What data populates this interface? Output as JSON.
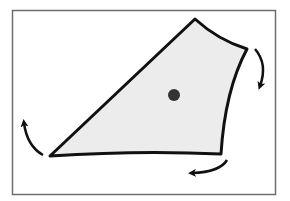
{
  "diagram": {
    "colors": {
      "background": "#ffffff",
      "frame": "#6e6e6e",
      "shape_fill": "#ececec",
      "shape_stroke": "#111111",
      "center_dot": "#333333",
      "arrows": "#111111"
    },
    "frame": {
      "x": 12,
      "y": 10,
      "width": 263,
      "height": 184
    },
    "shape": {
      "vertices": [
        {
          "name": "top",
          "x": 195,
          "y": 19
        },
        {
          "name": "right",
          "x": 247,
          "y": 49
        },
        {
          "name": "bottom-right",
          "x": 221,
          "y": 154
        },
        {
          "name": "left",
          "x": 50,
          "y": 156
        }
      ]
    },
    "center": {
      "x": 174,
      "y": 95,
      "r": 6
    },
    "arrows": [
      {
        "name": "right-arrow",
        "direction": "clockwise-down"
      },
      {
        "name": "bottom-arrow",
        "direction": "clockwise-left"
      },
      {
        "name": "left-arrow",
        "direction": "clockwise-up"
      }
    ]
  }
}
